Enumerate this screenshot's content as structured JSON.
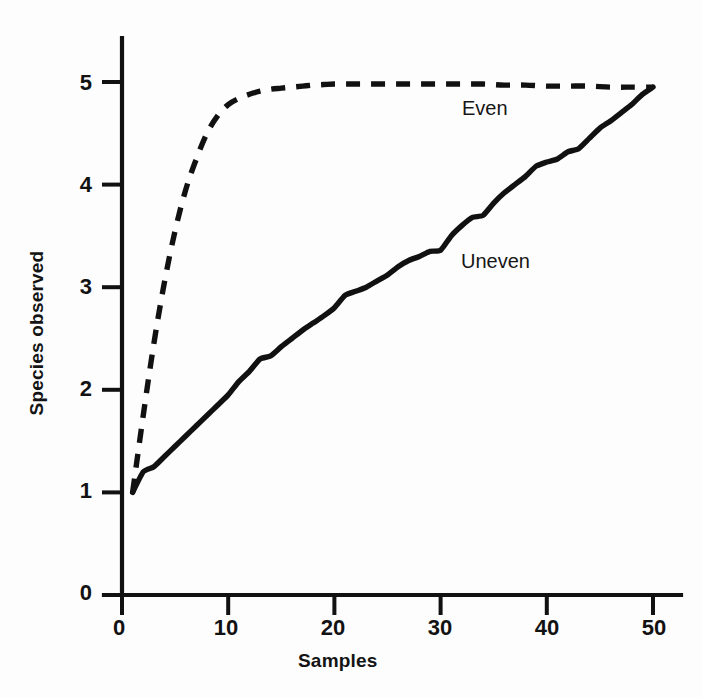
{
  "figure": {
    "background": "#fdfdfd",
    "ink_color": "#111111"
  },
  "axes": {
    "x_title": "Samples",
    "y_title": "Species observed",
    "x_ticks": [
      "0",
      "10",
      "20",
      "30",
      "40",
      "50"
    ],
    "y_ticks": [
      "0",
      "1",
      "2",
      "3",
      "4",
      "5"
    ]
  },
  "annotations": {
    "even_label": "Even",
    "uneven_label": "Uneven"
  },
  "chart_data": {
    "type": "line",
    "title": "",
    "subtitle": "",
    "xlabel": "Samples",
    "ylabel": "Species observed",
    "xlim": [
      0,
      52
    ],
    "ylim": [
      0,
      5.4
    ],
    "xticks": [
      0,
      10,
      20,
      30,
      40,
      50
    ],
    "yticks": [
      0,
      1,
      2,
      3,
      4,
      5
    ],
    "grid": false,
    "legend": "inline-annotations",
    "legend_position": "on-plot",
    "series": [
      {
        "name": "Even",
        "style": "dashed",
        "color": "#111111",
        "x": [
          1,
          2,
          3,
          4,
          5,
          6,
          7,
          8,
          9,
          10,
          11,
          12,
          13,
          14,
          15,
          16,
          17,
          18,
          19,
          20,
          22,
          24,
          26,
          28,
          30,
          32,
          34,
          36,
          38,
          40,
          42,
          44,
          46,
          48,
          50
        ],
        "y": [
          1.0,
          1.75,
          2.45,
          3.05,
          3.55,
          3.95,
          4.25,
          4.5,
          4.67,
          4.78,
          4.84,
          4.88,
          4.91,
          4.93,
          4.94,
          4.95,
          4.96,
          4.97,
          4.975,
          4.98,
          4.98,
          4.98,
          4.98,
          4.98,
          4.98,
          4.98,
          4.98,
          4.97,
          4.97,
          4.96,
          4.96,
          4.96,
          4.95,
          4.95,
          4.95
        ]
      },
      {
        "name": "Uneven",
        "style": "solid",
        "color": "#111111",
        "x": [
          1,
          2,
          3,
          4,
          5,
          6,
          7,
          8,
          9,
          10,
          11,
          12,
          13,
          14,
          15,
          16,
          17,
          18,
          19,
          20,
          21,
          22,
          23,
          24,
          25,
          26,
          27,
          28,
          29,
          30,
          31,
          32,
          33,
          34,
          35,
          36,
          37,
          38,
          39,
          40,
          41,
          42,
          43,
          44,
          45,
          46,
          47,
          48,
          49,
          50
        ],
        "y": [
          1.0,
          1.2,
          1.25,
          1.35,
          1.45,
          1.55,
          1.65,
          1.75,
          1.85,
          1.95,
          2.08,
          2.18,
          2.3,
          2.33,
          2.42,
          2.5,
          2.58,
          2.65,
          2.72,
          2.8,
          2.92,
          2.96,
          3.0,
          3.06,
          3.12,
          3.2,
          3.26,
          3.3,
          3.35,
          3.36,
          3.5,
          3.6,
          3.68,
          3.7,
          3.82,
          3.92,
          4.0,
          4.08,
          4.18,
          4.22,
          4.25,
          4.32,
          4.35,
          4.45,
          4.55,
          4.62,
          4.7,
          4.78,
          4.88,
          4.95
        ]
      }
    ]
  }
}
